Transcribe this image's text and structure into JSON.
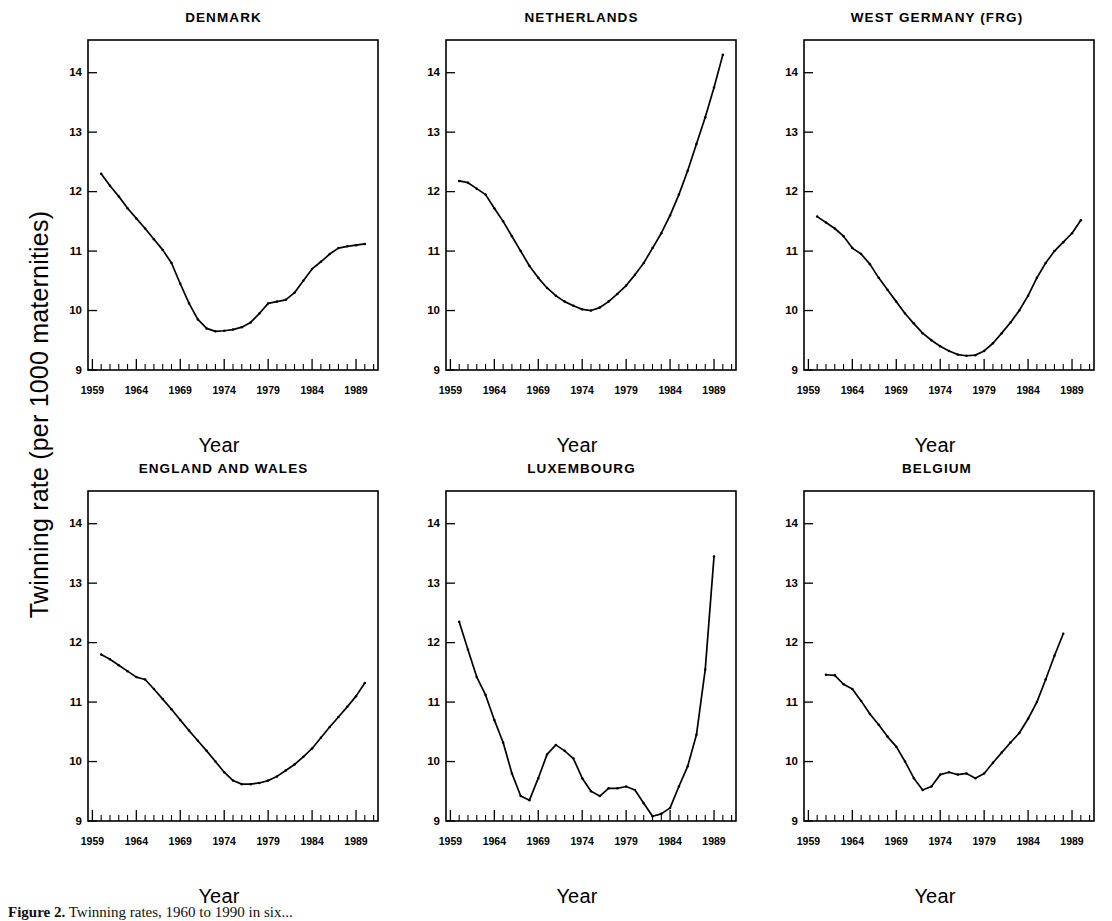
{
  "figure": {
    "ylabel": "Twinning rate (per 1000 maternities)",
    "xlabel": "Year",
    "caption_prefix": "Figure 2.",
    "caption_rest": "Twinning rates, 1960 to 1990 in six..."
  },
  "axis": {
    "y_ticks": [
      9,
      10,
      11,
      12,
      13,
      14
    ],
    "y_tick_labels": [
      "9",
      "10",
      "11",
      "12",
      "13",
      "14"
    ],
    "ylim": [
      9,
      14.55
    ],
    "x_ticks": [
      1959,
      1964,
      1969,
      1974,
      1979,
      1984,
      1989
    ],
    "x_tick_labels": [
      "1959",
      "1964",
      "1969",
      "1974",
      "1979",
      "1984",
      "1989"
    ],
    "xlim": [
      1958.5,
      1991.5
    ],
    "minor_tick_step": 1,
    "grid": false
  },
  "chart_data": [
    {
      "type": "line",
      "title": "DENMARK",
      "xlabel": "Year",
      "ylabel": "Twinning rate (per 1000 maternities)",
      "ylim": [
        9,
        14.55
      ],
      "xlim": [
        1958.5,
        1991.5
      ],
      "x": [
        1960,
        1961,
        1962,
        1963,
        1964,
        1965,
        1966,
        1967,
        1968,
        1969,
        1970,
        1971,
        1972,
        1973,
        1974,
        1975,
        1976,
        1977,
        1978,
        1979,
        1980,
        1981,
        1982,
        1983,
        1984,
        1985,
        1986,
        1987,
        1988,
        1989,
        1990
      ],
      "values": [
        12.3,
        12.1,
        11.92,
        11.72,
        11.55,
        11.38,
        11.2,
        11.02,
        10.8,
        10.45,
        10.12,
        9.85,
        9.7,
        9.65,
        9.66,
        9.68,
        9.72,
        9.8,
        9.95,
        10.12,
        10.15,
        10.18,
        10.3,
        10.5,
        10.7,
        10.82,
        10.95,
        11.05,
        11.08,
        11.1,
        11.12
      ]
    },
    {
      "type": "line",
      "title": "NETHERLANDS",
      "xlabel": "Year",
      "ylabel": "Twinning rate (per 1000 maternities)",
      "ylim": [
        9,
        14.55
      ],
      "xlim": [
        1958.5,
        1991.5
      ],
      "x": [
        1960,
        1961,
        1962,
        1963,
        1964,
        1965,
        1966,
        1967,
        1968,
        1969,
        1970,
        1971,
        1972,
        1973,
        1974,
        1975,
        1976,
        1977,
        1978,
        1979,
        1980,
        1981,
        1982,
        1983,
        1984,
        1985,
        1986,
        1987,
        1988,
        1989,
        1990
      ],
      "values": [
        12.18,
        12.15,
        12.05,
        11.95,
        11.72,
        11.5,
        11.25,
        11.0,
        10.75,
        10.55,
        10.38,
        10.25,
        10.15,
        10.08,
        10.02,
        10.0,
        10.05,
        10.15,
        10.28,
        10.42,
        10.6,
        10.8,
        11.05,
        11.3,
        11.6,
        11.95,
        12.35,
        12.8,
        13.25,
        13.75,
        14.3
      ]
    },
    {
      "type": "line",
      "title": "WEST GERMANY (FRG)",
      "xlabel": "Year",
      "ylabel": "Twinning rate (per 1000 maternities)",
      "ylim": [
        9,
        14.55
      ],
      "xlim": [
        1958.5,
        1991.5
      ],
      "x": [
        1960,
        1961,
        1962,
        1963,
        1964,
        1965,
        1966,
        1967,
        1968,
        1969,
        1970,
        1971,
        1972,
        1973,
        1974,
        1975,
        1976,
        1977,
        1978,
        1979,
        1980,
        1981,
        1982,
        1983,
        1984,
        1985,
        1986,
        1987,
        1988,
        1989,
        1990
      ],
      "values": [
        11.58,
        11.48,
        11.38,
        11.25,
        11.05,
        10.95,
        10.78,
        10.55,
        10.35,
        10.15,
        9.95,
        9.78,
        9.62,
        9.5,
        9.4,
        9.32,
        9.26,
        9.24,
        9.25,
        9.32,
        9.45,
        9.62,
        9.8,
        10.0,
        10.25,
        10.55,
        10.8,
        11.0,
        11.15,
        11.3,
        11.52
      ]
    },
    {
      "type": "line",
      "title": "ENGLAND AND WALES",
      "xlabel": "Year",
      "ylabel": "Twinning rate (per 1000 maternities)",
      "ylim": [
        9,
        14.55
      ],
      "xlim": [
        1958.5,
        1991.5
      ],
      "x": [
        1960,
        1961,
        1962,
        1963,
        1964,
        1965,
        1966,
        1967,
        1968,
        1969,
        1970,
        1971,
        1972,
        1973,
        1974,
        1975,
        1976,
        1977,
        1978,
        1979,
        1980,
        1981,
        1982,
        1983,
        1984,
        1985,
        1986,
        1987,
        1988,
        1989,
        1990
      ],
      "values": [
        11.8,
        11.72,
        11.62,
        11.52,
        11.42,
        11.38,
        11.22,
        11.05,
        10.88,
        10.7,
        10.52,
        10.35,
        10.18,
        10.0,
        9.82,
        9.68,
        9.62,
        9.62,
        9.64,
        9.68,
        9.75,
        9.85,
        9.95,
        10.08,
        10.22,
        10.4,
        10.58,
        10.75,
        10.92,
        11.1,
        11.32
      ]
    },
    {
      "type": "line",
      "title": "LUXEMBOURG",
      "xlabel": "Year",
      "ylabel": "Twinning rate (per 1000 maternities)",
      "ylim": [
        9,
        14.55
      ],
      "xlim": [
        1958.5,
        1991.5
      ],
      "x": [
        1960,
        1961,
        1962,
        1963,
        1964,
        1965,
        1966,
        1967,
        1968,
        1969,
        1970,
        1971,
        1972,
        1973,
        1974,
        1975,
        1976,
        1977,
        1978,
        1979,
        1980,
        1981,
        1982,
        1983,
        1984,
        1985,
        1986,
        1987,
        1988,
        1989
      ],
      "values": [
        12.35,
        11.88,
        11.42,
        11.12,
        10.7,
        10.32,
        9.8,
        9.42,
        9.35,
        9.72,
        10.12,
        10.28,
        10.18,
        10.05,
        9.72,
        9.5,
        9.42,
        9.55,
        9.55,
        9.58,
        9.52,
        9.3,
        9.08,
        9.12,
        9.22,
        9.58,
        9.92,
        10.45,
        11.55,
        13.45
      ]
    },
    {
      "type": "line",
      "title": "BELGIUM",
      "xlabel": "Year",
      "ylabel": "Twinning rate (per 1000 maternities)",
      "ylim": [
        9,
        14.55
      ],
      "xlim": [
        1958.5,
        1991.5
      ],
      "x": [
        1961,
        1962,
        1963,
        1964,
        1965,
        1966,
        1967,
        1968,
        1969,
        1970,
        1971,
        1972,
        1973,
        1974,
        1975,
        1976,
        1977,
        1978,
        1979,
        1980,
        1981,
        1982,
        1983,
        1984,
        1985,
        1986,
        1987,
        1988
      ],
      "values": [
        11.46,
        11.45,
        11.3,
        11.22,
        11.02,
        10.8,
        10.62,
        10.42,
        10.25,
        10.0,
        9.72,
        9.52,
        9.58,
        9.78,
        9.82,
        9.78,
        9.8,
        9.72,
        9.8,
        9.98,
        10.15,
        10.32,
        10.48,
        10.72,
        11.0,
        11.38,
        11.78,
        12.15
      ]
    }
  ]
}
